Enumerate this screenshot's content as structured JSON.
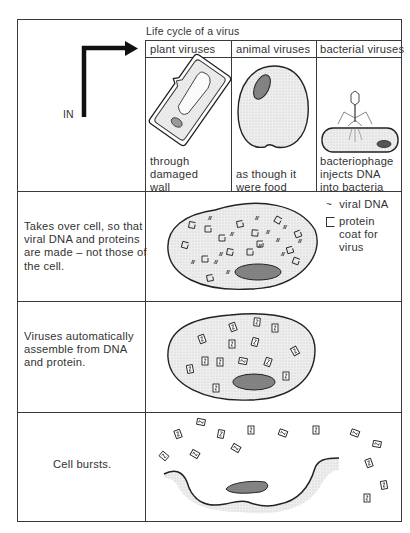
{
  "title": "Life cycle of a virus",
  "entry_label": "IN",
  "columns": [
    {
      "heading": "plant viruses",
      "caption": [
        "through",
        "damaged",
        "wall"
      ]
    },
    {
      "heading": "animal viruses",
      "caption": [
        "as though it",
        "were food"
      ]
    },
    {
      "heading": "bacterial viruses",
      "caption": [
        "bacteriophage",
        "injects DNA",
        "into bacteria"
      ]
    }
  ],
  "stages": [
    {
      "description": [
        "Takes over cell, so that",
        "viral DNA and proteins",
        "are made – not those of",
        "the cell."
      ]
    },
    {
      "description": [
        "Viruses automatically",
        "assemble from DNA",
        "and protein."
      ]
    },
    {
      "description": [
        "Cell bursts."
      ]
    }
  ],
  "legend": [
    {
      "icon": "viral-dna-icon",
      "symbol": "≈",
      "label": [
        "viral DNA"
      ]
    },
    {
      "icon": "protein-coat-icon",
      "symbol": "□",
      "label": [
        "protein",
        "coat for",
        "virus"
      ]
    }
  ],
  "colors": {
    "line": "#3a3a3a",
    "cytoplasm": "#e6e6e6",
    "nucleus": "#8a8a8a"
  }
}
